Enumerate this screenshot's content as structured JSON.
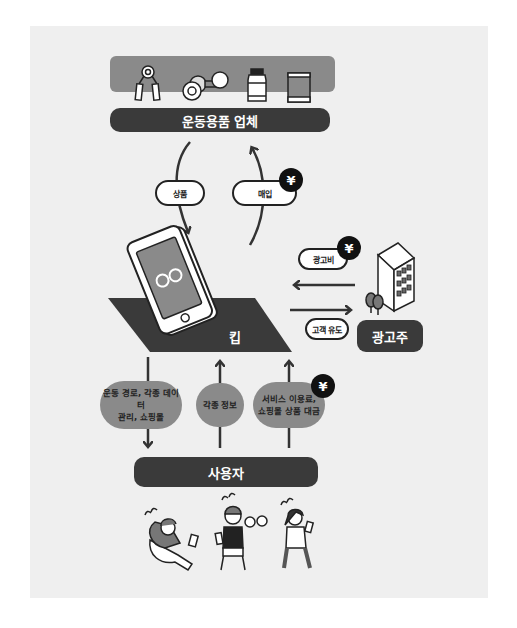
{
  "diagram": {
    "top_entity": {
      "label": "운동용품 업체",
      "icons": [
        "hand-grip-icon",
        "dumbbell-icon",
        "supplement-bottle-icon",
        "protein-can-icon"
      ]
    },
    "flows_top": [
      {
        "label": "상품",
        "direction": "down",
        "money": false
      },
      {
        "label": "매입",
        "direction": "up",
        "money": true
      }
    ],
    "center_entity": {
      "label": "킵"
    },
    "advertiser": {
      "label": "광고주"
    },
    "flows_side": [
      {
        "label": "광고비",
        "direction": "left",
        "money": true
      },
      {
        "label": "고객 유도",
        "direction": "right",
        "money": false
      }
    ],
    "flows_bottom": [
      {
        "label_line1": "운동 경로, 각종 데이터",
        "label_line2": "관리, 쇼핑몰",
        "direction": "down",
        "money": false
      },
      {
        "label_line1": "각종 정보",
        "label_line2": "",
        "direction": "up",
        "money": false
      },
      {
        "label_line1": "서비스 이용료,",
        "label_line2": "쇼핑몰 상품 대금",
        "direction": "up",
        "money": true
      }
    ],
    "bottom_entity": {
      "label": "사용자"
    },
    "yen_symbol": "¥",
    "colors": {
      "panel": "#efefef",
      "dark": "#3a3a3a",
      "mid_gray": "#8a8a8a",
      "black": "#111111"
    }
  }
}
